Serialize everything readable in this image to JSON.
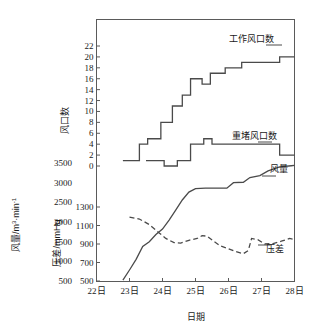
{
  "chart_data": {
    "type": "line",
    "title": "",
    "xlabel": "日期",
    "x_tick_labels": [
      "22日",
      "23日",
      "24日",
      "25日",
      "26日",
      "27日",
      "28日"
    ],
    "x_values": [
      22,
      23,
      24,
      25,
      26,
      27,
      28
    ],
    "xlim": [
      22,
      28
    ],
    "grid": false,
    "legend": "inline-labels",
    "axes": [
      {
        "id": "vents",
        "ylabel": "风口数",
        "unit": "",
        "ylim": [
          0,
          22
        ],
        "ticks": [
          0,
          2,
          4,
          6,
          8,
          10,
          12,
          14,
          16,
          18,
          20,
          22
        ],
        "position": "upper-left"
      },
      {
        "id": "pressure",
        "ylabel": "压差/mmHg",
        "unit": "mmHg",
        "ylim": [
          500,
          1300
        ],
        "ticks": [
          500,
          700,
          900,
          1100,
          1300
        ],
        "position": "lower-left-inner"
      },
      {
        "id": "airflow",
        "ylabel": "风量/m³·min⁻¹",
        "unit": "m³·min⁻¹",
        "ylim": [
          500,
          3500
        ],
        "ticks": [
          500,
          1000,
          1500,
          2000,
          2500,
          3000,
          3500
        ],
        "position": "lower-left-outer"
      }
    ],
    "series": [
      {
        "name": "工作风口数",
        "axis": "vents",
        "style": "step-solid",
        "points": [
          [
            22.8,
            1
          ],
          [
            23.3,
            1
          ],
          [
            23.3,
            4
          ],
          [
            23.55,
            4
          ],
          [
            23.55,
            5
          ],
          [
            23.95,
            5
          ],
          [
            23.95,
            8
          ],
          [
            24.3,
            8
          ],
          [
            24.3,
            11
          ],
          [
            24.6,
            11
          ],
          [
            24.6,
            13
          ],
          [
            24.85,
            13
          ],
          [
            24.85,
            16
          ],
          [
            25.2,
            16
          ],
          [
            25.2,
            15
          ],
          [
            25.45,
            15
          ],
          [
            25.45,
            17
          ],
          [
            25.9,
            17
          ],
          [
            25.9,
            18
          ],
          [
            26.4,
            18
          ],
          [
            26.4,
            19
          ],
          [
            27.55,
            19
          ],
          [
            27.55,
            20
          ],
          [
            28.0,
            20
          ]
        ]
      },
      {
        "name": "重堵风口数",
        "axis": "vents",
        "style": "step-solid",
        "points": [
          [
            23.5,
            1
          ],
          [
            24.05,
            1
          ],
          [
            24.05,
            0
          ],
          [
            24.45,
            0
          ],
          [
            24.45,
            1
          ],
          [
            24.85,
            1
          ],
          [
            24.85,
            4
          ],
          [
            25.25,
            4
          ],
          [
            25.25,
            5
          ],
          [
            25.5,
            5
          ],
          [
            25.5,
            4
          ],
          [
            27.55,
            4
          ],
          [
            27.55,
            2
          ],
          [
            28.0,
            2
          ]
        ]
      },
      {
        "name": "风量",
        "axis": "airflow",
        "style": "solid",
        "points": [
          [
            22.8,
            520
          ],
          [
            23.0,
            780
          ],
          [
            23.2,
            1050
          ],
          [
            23.4,
            1380
          ],
          [
            23.6,
            1500
          ],
          [
            23.8,
            1680
          ],
          [
            24.0,
            1820
          ],
          [
            24.2,
            2050
          ],
          [
            24.4,
            2300
          ],
          [
            24.6,
            2560
          ],
          [
            24.8,
            2760
          ],
          [
            25.0,
            2850
          ],
          [
            25.3,
            2860
          ],
          [
            25.7,
            2860
          ],
          [
            25.95,
            2860
          ],
          [
            26.15,
            3000
          ],
          [
            26.45,
            3010
          ],
          [
            26.65,
            3130
          ],
          [
            26.95,
            3180
          ],
          [
            27.2,
            3300
          ],
          [
            27.55,
            3400
          ],
          [
            27.9,
            3430
          ],
          [
            28.0,
            3440
          ]
        ]
      },
      {
        "name": "压差",
        "axis": "pressure",
        "style": "dashed",
        "points": [
          [
            23.0,
            1190
          ],
          [
            23.3,
            1170
          ],
          [
            23.6,
            1110
          ],
          [
            23.9,
            1020
          ],
          [
            24.1,
            960
          ],
          [
            24.35,
            915
          ],
          [
            24.55,
            910
          ],
          [
            24.8,
            940
          ],
          [
            25.05,
            960
          ],
          [
            25.2,
            990
          ],
          [
            25.35,
            985
          ],
          [
            25.55,
            930
          ],
          [
            25.75,
            880
          ],
          [
            25.95,
            855
          ],
          [
            26.2,
            820
          ],
          [
            26.45,
            795
          ],
          [
            26.6,
            830
          ],
          [
            26.7,
            960
          ],
          [
            26.9,
            945
          ],
          [
            27.1,
            900
          ],
          [
            27.35,
            905
          ],
          [
            27.6,
            930
          ],
          [
            27.85,
            960
          ],
          [
            28.0,
            950
          ]
        ]
      }
    ]
  },
  "labels": {
    "working_vents": "工作风口数",
    "blocked_vents": "重堵风口数",
    "airflow": "风量",
    "pressure": "压差",
    "axis_vents": "风口数",
    "axis_pressure": "压差/mmHg",
    "axis_airflow_part1": "风量/m",
    "axis_airflow_sup1": "3",
    "axis_airflow_part2": "·min",
    "axis_airflow_sup2": "-1",
    "xaxis": "日期"
  },
  "ticks": {
    "vents": [
      "22",
      "20",
      "18",
      "16",
      "14",
      "12",
      "10",
      "8",
      "6",
      "4",
      "2",
      "0"
    ],
    "pressure": [
      "1300",
      "1100",
      "900",
      "700",
      "500"
    ],
    "airflow": [
      "3500",
      "3000",
      "2500",
      "2000",
      "1500",
      "1000",
      "500"
    ],
    "dates": [
      "22日",
      "23日",
      "24日",
      "25日",
      "26日",
      "27日",
      "28日"
    ]
  },
  "colors": {
    "line": "#4a4a4a",
    "axis": "#5a5a5a",
    "text": "#1a1a1a",
    "background": "#ffffff"
  }
}
